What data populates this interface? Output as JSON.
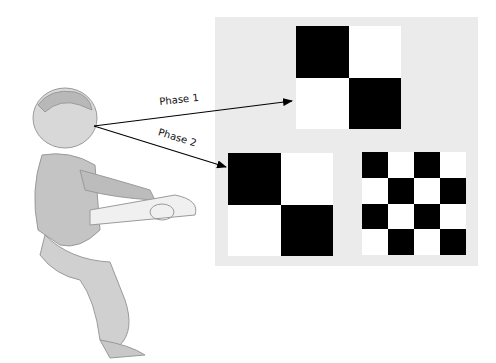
{
  "figure": {
    "arrows": [
      {
        "label": "Phase 1",
        "target": "phase1-stimulus"
      },
      {
        "label": "Phase 2",
        "target": "phase2-stimuli"
      }
    ],
    "stimuli": {
      "phase1": {
        "type": "checkerboard",
        "grid": "2x2"
      },
      "phase2": [
        {
          "type": "checkerboard",
          "grid": "2x2"
        },
        {
          "type": "checkerboard",
          "grid": "4x4"
        }
      ]
    },
    "colors": {
      "panel": "#ebebeb",
      "dark": "#000000",
      "light": "#ffffff"
    }
  }
}
